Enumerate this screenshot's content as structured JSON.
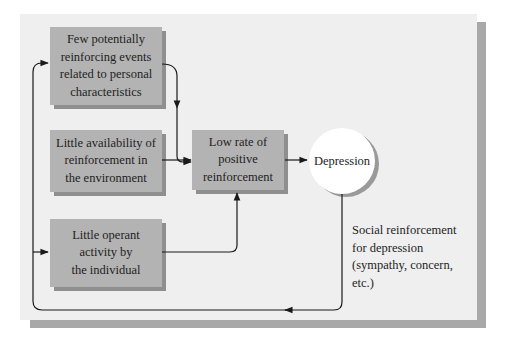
{
  "diagram": {
    "colors": {
      "panel_background": "#efefef",
      "panel_shadow": "#a8a8a8",
      "box_fill": "#b3b3b3",
      "box_shadow": "#8f8f8f",
      "circle_fill": "#ffffff",
      "line": "#1a1a1a"
    },
    "nodes": {
      "cause_personal": {
        "label": "Few potentially reinforcing events related to personal characteristics",
        "lines": [
          "Few potentially",
          "reinforcing events",
          "related to personal",
          "characteristics"
        ]
      },
      "cause_environment": {
        "label": "Little availability of reinforcement in the environment",
        "lines": [
          "Little availability of",
          "reinforcement in",
          "the environment"
        ]
      },
      "cause_activity": {
        "label": "Little operant activity by the individual",
        "lines": [
          "Little operant",
          "activity by",
          "the individual"
        ]
      },
      "low_rate": {
        "label": "Low rate of positive reinforcement",
        "lines": [
          "Low rate of",
          "positive",
          "reinforcement"
        ]
      },
      "depression": {
        "label": "Depression"
      }
    },
    "feedback_caption": {
      "lines": [
        "Social reinforcement",
        "for depression",
        "(sympathy, concern,",
        "etc.)"
      ]
    },
    "edges": [
      {
        "from": "cause_personal",
        "to": "low_rate"
      },
      {
        "from": "cause_environment",
        "to": "low_rate"
      },
      {
        "from": "cause_activity",
        "to": "low_rate"
      },
      {
        "from": "low_rate",
        "to": "depression"
      },
      {
        "from": "depression",
        "to": "cause_personal",
        "label": "Social reinforcement for depression (sympathy, concern, etc.)"
      },
      {
        "from": "depression",
        "to": "cause_activity",
        "label": "Social reinforcement for depression (sympathy, concern, etc.)"
      }
    ]
  }
}
